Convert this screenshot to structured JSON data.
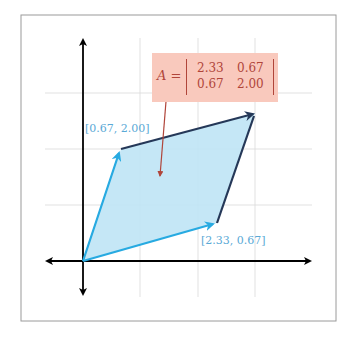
{
  "diagram": {
    "colors": {
      "axis": "#000000",
      "grid": "#d9d9d9",
      "frame": "#9a9a9a",
      "fill": "#bfe4f5",
      "vector": "#27aae1",
      "edge": "#253858",
      "callout_bg": "#f9c9bd",
      "callout_text": "#b0453a",
      "label_text": "#5aa9d6"
    },
    "vectors": [
      {
        "name": "v1",
        "label": "[0.67, 2.00]",
        "x": 0.67,
        "y": 2.0
      },
      {
        "name": "v2",
        "label": "[2.33, 0.67]",
        "x": 2.33,
        "y": 0.67
      }
    ],
    "sum_vertex": {
      "x": 3.0,
      "y": 2.67
    },
    "callout": {
      "lhs": "A =",
      "matrix": [
        [
          "2.33",
          "0.67"
        ],
        [
          "0.67",
          "2.00"
        ]
      ]
    }
  }
}
